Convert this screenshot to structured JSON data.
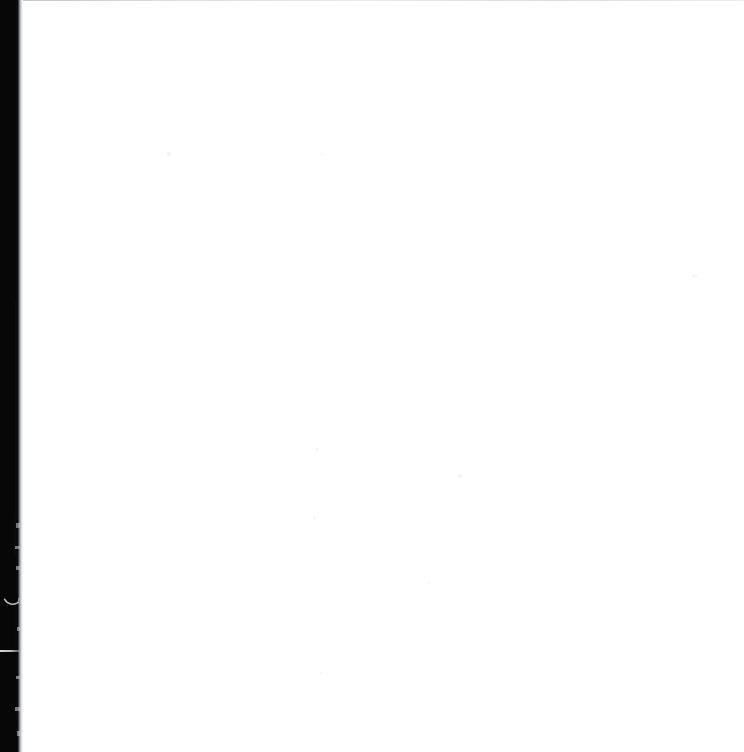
{
  "page": {
    "kind": "scanned-document-page",
    "width": 744,
    "height": 752,
    "background_color": "#ffffff",
    "content_text": "",
    "caption": "Blank scanned document page"
  },
  "gutter": {
    "name": "left-scan-gutter",
    "color": "#070708",
    "fringe_color": "#b9bbbf",
    "width_px": 19,
    "fringe_width_px": 5
  },
  "artifacts": {
    "top_edge_line": {
      "name": "top-edge-hairline",
      "color": "#c3c5c9"
    },
    "curl_mark": {
      "name": "page-curl-hook-mark",
      "color": "#d8dade"
    },
    "streak_line": {
      "name": "horizontal-light-streak",
      "color": "#e1e2e5",
      "y_px": 650
    },
    "dust_color": "#cfd0d4"
  }
}
